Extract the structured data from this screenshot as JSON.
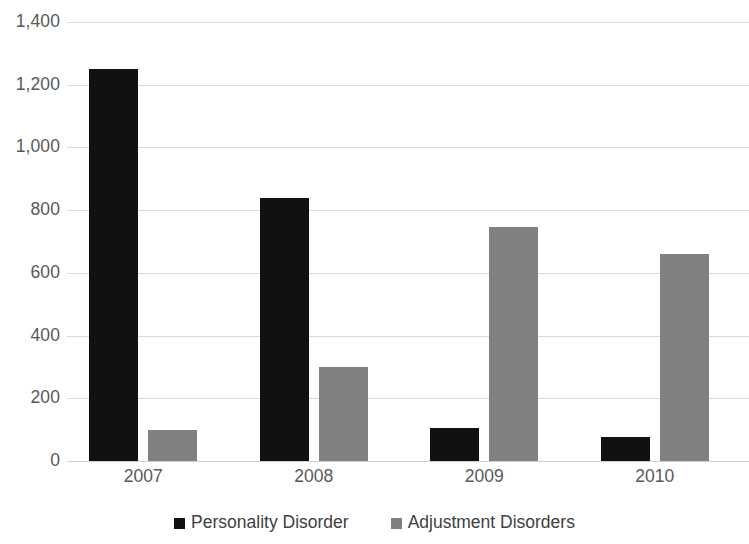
{
  "chart_data": {
    "type": "bar",
    "title": "",
    "subtitle": "",
    "xlabel": "",
    "ylabel": "",
    "categories": [
      "2007",
      "2008",
      "2009",
      "2010"
    ],
    "series": [
      {
        "name": "Personality Disorder",
        "color": "#111111",
        "values": [
          1250,
          840,
          105,
          75
        ]
      },
      {
        "name": "Adjustment Disorders",
        "color": "#808080",
        "values": [
          100,
          300,
          745,
          660
        ]
      }
    ],
    "ylim": [
      0,
      1400
    ],
    "ytick_step": 200,
    "ytick_labels": [
      "1,400",
      "1,200",
      "1,000",
      "800",
      "600",
      "400",
      "200",
      "0"
    ],
    "ytick_values": [
      1400,
      1200,
      1000,
      800,
      600,
      400,
      200,
      0
    ],
    "grid": true,
    "grid_axis": "y",
    "grid_color": "#d9d9d9",
    "legend_position": "bottom",
    "background": "#ffffff",
    "axis_label_color": "#595959",
    "legend_label_color": "#404040"
  }
}
